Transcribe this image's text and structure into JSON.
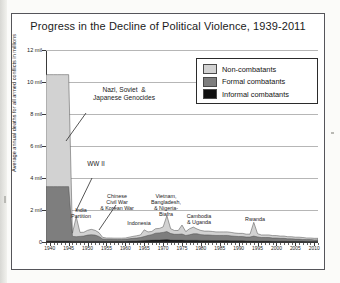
{
  "chart_data": {
    "type": "area",
    "title": "Progress in the Decline of Political Violence, 1939-2011",
    "xlabel": "",
    "ylabel": "Average annual deaths for all armed conflicts in millions",
    "xlim": [
      1939,
      2011
    ],
    "ylim": [
      0,
      12
    ],
    "grid": true,
    "legend_position": "top-right",
    "stacked": true,
    "ytick_labels": [
      "0",
      "2 mil",
      "4 mil",
      "6 mil",
      "8 mil",
      "10 mil",
      "12 mil"
    ],
    "ytick_values": [
      0,
      2,
      4,
      6,
      8,
      10,
      12
    ],
    "xtick_labels": [
      "1940",
      "1945",
      "1950",
      "1955",
      "1960",
      "1965",
      "1970",
      "1975",
      "1980",
      "1985",
      "1990",
      "1995",
      "2000",
      "2005",
      "2010"
    ],
    "xtick_values": [
      1940,
      1945,
      1950,
      1955,
      1960,
      1965,
      1970,
      1975,
      1980,
      1985,
      1990,
      1995,
      2000,
      2005,
      2010
    ],
    "colors": {
      "non_combatants": "#d2d2d2",
      "formal_combatants": "#7e7e7e",
      "informal_combatants": "#101010",
      "gridline": "#b6b6b6",
      "axis": "#3a3a3a",
      "frame": "#55555a"
    },
    "x": [
      1939,
      1940,
      1941,
      1942,
      1943,
      1944,
      1945,
      1946,
      1947,
      1948,
      1949,
      1950,
      1951,
      1952,
      1953,
      1954,
      1955,
      1956,
      1957,
      1958,
      1959,
      1960,
      1961,
      1962,
      1963,
      1964,
      1965,
      1966,
      1967,
      1968,
      1969,
      1970,
      1971,
      1972,
      1973,
      1974,
      1975,
      1976,
      1977,
      1978,
      1979,
      1980,
      1981,
      1982,
      1983,
      1984,
      1985,
      1986,
      1987,
      1988,
      1989,
      1990,
      1991,
      1992,
      1993,
      1994,
      1995,
      1996,
      1997,
      1998,
      1999,
      2000,
      2001,
      2002,
      2003,
      2004,
      2005,
      2006,
      2007,
      2008,
      2009,
      2010,
      2011
    ],
    "series": [
      {
        "name": "Informal combatants",
        "color": "#101010",
        "values": [
          0.06,
          0.06,
          0.06,
          0.06,
          0.06,
          0.06,
          0.06,
          0.05,
          0.05,
          0.05,
          0.05,
          0.05,
          0.05,
          0.05,
          0.05,
          0.05,
          0.05,
          0.05,
          0.05,
          0.05,
          0.05,
          0.05,
          0.06,
          0.07,
          0.07,
          0.08,
          0.1,
          0.11,
          0.12,
          0.13,
          0.13,
          0.14,
          0.15,
          0.13,
          0.12,
          0.12,
          0.12,
          0.11,
          0.11,
          0.11,
          0.11,
          0.1,
          0.1,
          0.1,
          0.09,
          0.09,
          0.09,
          0.09,
          0.09,
          0.08,
          0.08,
          0.08,
          0.08,
          0.07,
          0.07,
          0.07,
          0.06,
          0.06,
          0.06,
          0.06,
          0.05,
          0.05,
          0.05,
          0.05,
          0.04,
          0.04,
          0.04,
          0.04,
          0.04,
          0.03,
          0.03,
          0.03,
          0.03
        ]
      },
      {
        "name": "Formal combatants",
        "color": "#7e7e7e",
        "values": [
          3.4,
          3.4,
          3.4,
          3.4,
          3.4,
          3.4,
          3.4,
          0.3,
          0.28,
          0.3,
          0.32,
          0.38,
          0.4,
          0.38,
          0.3,
          0.14,
          0.12,
          0.12,
          0.11,
          0.11,
          0.11,
          0.12,
          0.14,
          0.16,
          0.18,
          0.2,
          0.24,
          0.3,
          0.34,
          0.42,
          0.44,
          0.46,
          0.5,
          0.4,
          0.36,
          0.36,
          0.38,
          0.3,
          0.34,
          0.4,
          0.4,
          0.36,
          0.34,
          0.34,
          0.33,
          0.32,
          0.32,
          0.32,
          0.32,
          0.3,
          0.28,
          0.26,
          0.26,
          0.24,
          0.24,
          0.3,
          0.26,
          0.22,
          0.22,
          0.22,
          0.2,
          0.2,
          0.18,
          0.18,
          0.16,
          0.16,
          0.14,
          0.14,
          0.12,
          0.12,
          0.12,
          0.1,
          0.1
        ]
      },
      {
        "name": "Non-combatants",
        "color": "#d2d2d2",
        "values": [
          7.0,
          7.0,
          7.0,
          7.0,
          7.0,
          7.0,
          7.0,
          0.2,
          1.25,
          0.25,
          0.24,
          0.3,
          0.34,
          0.3,
          0.24,
          0.1,
          0.08,
          0.08,
          0.08,
          0.08,
          0.08,
          0.08,
          0.1,
          0.12,
          0.14,
          0.16,
          0.42,
          0.22,
          0.2,
          0.28,
          0.28,
          0.34,
          1.0,
          0.3,
          0.24,
          0.24,
          0.56,
          0.24,
          0.38,
          0.42,
          0.3,
          0.26,
          0.24,
          0.24,
          0.24,
          0.22,
          0.22,
          0.22,
          0.22,
          0.22,
          0.2,
          0.2,
          0.2,
          0.18,
          0.18,
          0.86,
          0.2,
          0.16,
          0.16,
          0.16,
          0.15,
          0.15,
          0.14,
          0.14,
          0.13,
          0.13,
          0.12,
          0.12,
          0.12,
          0.1,
          0.1,
          0.1,
          0.1
        ]
      }
    ],
    "annotations": [
      {
        "id": "nazi-soviet-japanese-genocides",
        "text": "Nazi, Soviet  &\nJapanese Genocides",
        "size": "big"
      },
      {
        "id": "ww2",
        "text": "WW II",
        "size": "med"
      },
      {
        "id": "india-partition",
        "text": "India\nPartition",
        "size": "small"
      },
      {
        "id": "chinese-civil-war-korean-war",
        "text": "Chinese\nCivil War\n& Korean War",
        "size": "small"
      },
      {
        "id": "indonesia",
        "text": "Indonesia",
        "size": "small"
      },
      {
        "id": "vietnam-bangladesh-nigeria-biafra",
        "text": "Vietnam,\nBangladesh,\n& Nigeria-\nBiafra",
        "size": "small"
      },
      {
        "id": "cambodia-uganda",
        "text": "Cambodia\n& Uganda",
        "size": "small"
      },
      {
        "id": "rwanda",
        "text": "Rwanda",
        "size": "small"
      }
    ]
  },
  "legend": {
    "items": [
      {
        "label": "Non-combatants",
        "color": "#d2d2d2"
      },
      {
        "label": "Formal combatants",
        "color": "#7e7e7e"
      },
      {
        "label": "Informal combatants",
        "color": "#101010"
      }
    ]
  }
}
